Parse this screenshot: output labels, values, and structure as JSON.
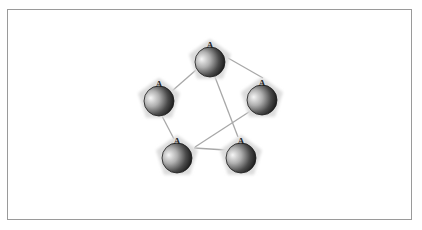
{
  "diagram": {
    "background": "#ffffff",
    "frame_color": "#9a9a9a",
    "edge_color": "#a8a8a8",
    "node_shadow_color": "#dcdcdc",
    "node_gradient": {
      "light": "#f4f4f4",
      "mid": "#8a8a8a",
      "dark": "#1a1a1a"
    },
    "nodes": [
      {
        "id": "n1",
        "label": "A",
        "cx": 210,
        "cy": 62,
        "r": 15,
        "position": "top"
      },
      {
        "id": "n2",
        "label": "A",
        "cx": 159,
        "cy": 101,
        "r": 15,
        "position": "left"
      },
      {
        "id": "n3",
        "label": "A",
        "cx": 262,
        "cy": 100,
        "r": 15,
        "position": "right"
      },
      {
        "id": "n4",
        "label": "A",
        "cx": 177,
        "cy": 158,
        "r": 15,
        "position": "bottom-left"
      },
      {
        "id": "n5",
        "label": "A",
        "cx": 241,
        "cy": 158,
        "r": 15,
        "position": "bottom-right"
      }
    ],
    "edges": [
      {
        "from": "n1",
        "to": "n2",
        "x1": 196,
        "y1": 70,
        "x2": 172,
        "y2": 91
      },
      {
        "from": "n1",
        "to": "n3",
        "x1": 228,
        "y1": 58,
        "x2": 263,
        "y2": 78
      },
      {
        "from": "n1",
        "to": "n5",
        "x1": 215,
        "y1": 77,
        "x2": 238,
        "y2": 137
      },
      {
        "from": "n2",
        "to": "n4",
        "x1": 162,
        "y1": 116,
        "x2": 174,
        "y2": 139
      },
      {
        "from": "n4",
        "to": "n3",
        "x1": 195,
        "y1": 147,
        "x2": 252,
        "y2": 110
      },
      {
        "from": "n4",
        "to": "n5",
        "x1": 194,
        "y1": 148,
        "x2": 226,
        "y2": 150
      }
    ]
  }
}
